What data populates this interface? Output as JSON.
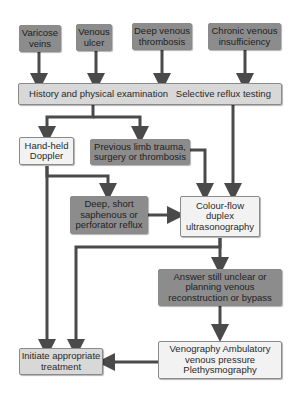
{
  "diagram": {
    "type": "flowchart",
    "presentations": [
      {
        "id": "varicose",
        "label": "Varicose veins"
      },
      {
        "id": "ulcer",
        "label": "Venous ulcer"
      },
      {
        "id": "dvt",
        "label": "Deep venous thrombosis"
      },
      {
        "id": "cvi",
        "label": "Chronic venous insufficiency"
      }
    ],
    "history": "History and physical examination   Selective reflux testing",
    "doppler": "Hand-held Doppler",
    "previous": "Previous limb trauma, surgery or thrombosis",
    "deep": "Deep, short saphenous or perforator reflux",
    "duplex": "Colour-flow duplex ultrasonography",
    "unclear": "Answer still unclear or planning venous reconstruction or bypass",
    "tests": "Venography Ambulatory venous pressure Plethysmography",
    "treatment": "Initiate appropriate treatment"
  },
  "colors": {
    "dark_box": "#8c8c8c",
    "mid_box": "#d8d8d8",
    "light_box": "#f2f2f2",
    "arrow": "#4a4a4a"
  }
}
